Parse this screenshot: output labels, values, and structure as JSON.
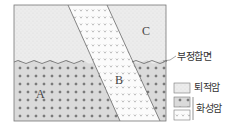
{
  "diagram": {
    "title": "",
    "labels": {
      "A": "A",
      "B": "B",
      "C": "C"
    },
    "unconformity_label": "부정합면",
    "legend": {
      "sedimentary": "퇴적암",
      "igneous": "화성암"
    }
  },
  "colors": {
    "sedimentary_fill": "#ebebeb",
    "igneous_A_fill": "#d9d9d9",
    "igneous_B_fill": "#fbfbfb",
    "line": "#555555",
    "text": "#333333"
  }
}
